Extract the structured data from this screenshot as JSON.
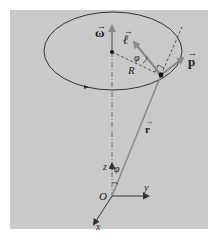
{
  "figure": {
    "background_color": "#c9c9c9",
    "vector_color": "#8a8a8a",
    "line_color": "#333333",
    "labels": {
      "omega": "ω",
      "ell": "ℓ",
      "p": "p",
      "r": "r",
      "R": "R",
      "phi_top": "φ",
      "phi_bottom": "φ",
      "origin": "O",
      "axis_x": "x",
      "axis_y": "y",
      "axis_z": "z",
      "vec_arrow": "⃗"
    }
  }
}
